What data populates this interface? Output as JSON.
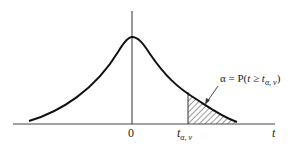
{
  "diagram": {
    "type": "t-distribution-density",
    "colors": {
      "ink": "#222222",
      "background": "#ffffff"
    },
    "axis": {
      "x_label": "t",
      "origin_label": "0",
      "critical_value_label": "t",
      "critical_value_sub": "α, ν"
    },
    "annotation": {
      "text_prefix": "α = P(",
      "text_var": "t",
      "text_rel": " ≥ ",
      "text_var2": "t",
      "text_sub": "α, ν",
      "text_suffix": ")"
    },
    "shaded_region": "right tail beyond t_{α,ν}"
  }
}
